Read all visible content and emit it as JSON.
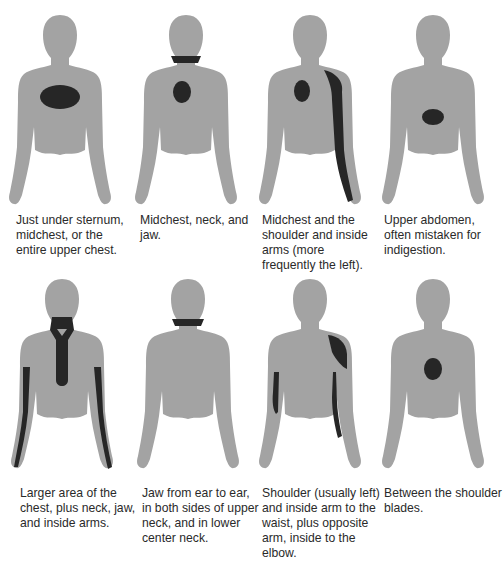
{
  "colors": {
    "body": "#a3a3a3",
    "pain": "#262626",
    "text": "#2a2a2a"
  },
  "figures": [
    {
      "caption": "Just under sternum, midchest, or the entire upper chest.",
      "pain_regions": [
        "upper-chest-wide"
      ]
    },
    {
      "caption": "Midchest, neck, and jaw.",
      "pain_regions": [
        "midchest",
        "neck-band"
      ]
    },
    {
      "caption": "Midchest and the shoulder and inside arms (more frequently the left).",
      "pain_regions": [
        "midchest",
        "left-shoulder-arm"
      ]
    },
    {
      "caption": "Upper abdomen, often mistaken for indigestion.",
      "pain_regions": [
        "upper-abdomen"
      ]
    },
    {
      "caption": "Larger area of the chest, plus neck, jaw, and inside arms.",
      "pain_regions": [
        "neck-chest-tie",
        "inside-arms-both"
      ]
    },
    {
      "caption": "Jaw from ear to ear, in both sides of upper neck, and in lower center neck.",
      "pain_regions": [
        "neck-band"
      ]
    },
    {
      "caption": "Shoulder (usually left) and inside arm to the waist, plus opposite arm, inside to the elbow.",
      "pain_regions": [
        "left-shoulder",
        "left-inner-arm",
        "right-inner-arm-to-elbow"
      ]
    },
    {
      "caption": "Between the shoulder blades.",
      "pain_regions": [
        "between-shoulder-blades"
      ]
    }
  ]
}
